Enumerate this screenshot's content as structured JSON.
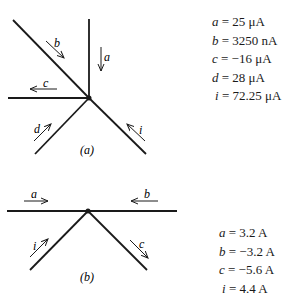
{
  "circuit_a": {
    "caption": "(a)",
    "branch_labels": {
      "a": "a",
      "b": "b",
      "c": "c",
      "d": "d",
      "i": "i"
    },
    "equations": [
      {
        "var": "a",
        "rhs": " = 25 μA"
      },
      {
        "var": "b",
        "rhs": " = 3250 nA"
      },
      {
        "var": "c",
        "rhs": " = −16 μA"
      },
      {
        "var": "d",
        "rhs": " = 28 μA"
      },
      {
        "var": "i",
        "rhs": " = 72.25 μA"
      }
    ]
  },
  "circuit_b": {
    "caption": "(b)",
    "branch_labels": {
      "a": "a",
      "b": "b",
      "c": "c",
      "i": "i"
    },
    "equations": [
      {
        "var": "a",
        "rhs": " = 3.2 A"
      },
      {
        "var": "b",
        "rhs": " = −3.2 A"
      },
      {
        "var": "c",
        "rhs": " = −5.6 A"
      },
      {
        "var": "i",
        "rhs": " = 4.4 A"
      }
    ]
  },
  "colors": {
    "line": "#1a1a1a",
    "background": "#ffffff"
  }
}
